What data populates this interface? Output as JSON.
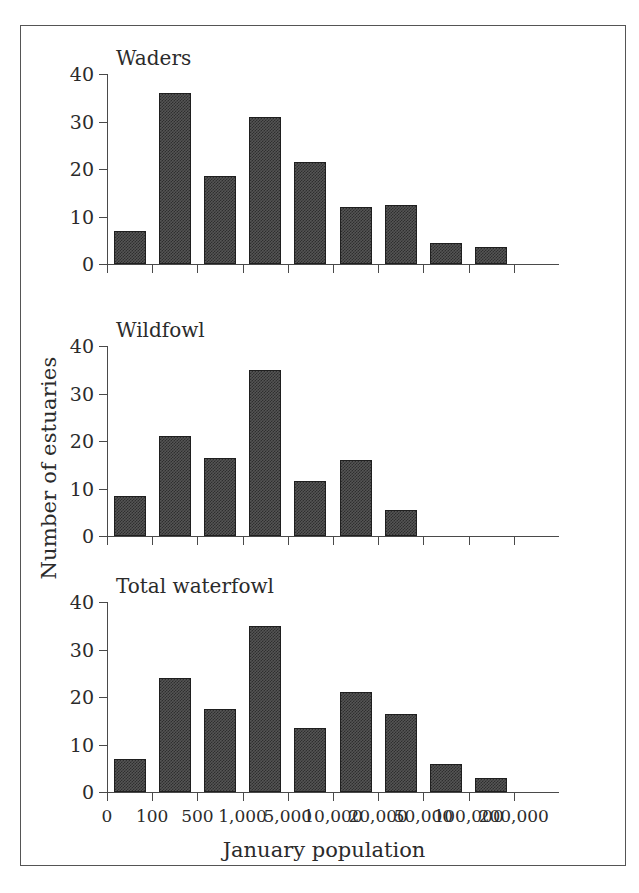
{
  "figure": {
    "y_axis_title": "Number of estuaries",
    "x_axis_title": "January population"
  },
  "chart_data": {
    "type": "bar",
    "title": "",
    "xlabel": "January population",
    "ylabel": "Number of estuaries",
    "ylim": [
      0,
      40
    ],
    "yticks": [
      0,
      10,
      20,
      30,
      40
    ],
    "ytick_labels": [
      "0",
      "10",
      "20",
      "30",
      "40"
    ],
    "grid": false,
    "legend": "none",
    "x_bin_edges": [
      0,
      100,
      500,
      1000,
      5000,
      10000,
      20000,
      50000,
      100000,
      200000
    ],
    "xtick_labels": [
      "0",
      "100",
      "500",
      "1,000",
      "5,000",
      "10,000",
      "20,000",
      "50,000",
      "100,000",
      "200,000"
    ],
    "bin_categories": [
      "0-100",
      "100-500",
      "500-1,000",
      "1,000-5,000",
      "5,000-10,000",
      "10,000-20,000",
      "20,000-50,000",
      "50,000-100,000",
      "100,000-200,000"
    ],
    "panels": [
      {
        "id": "waders",
        "title": "Waders",
        "values": [
          7,
          36,
          18.5,
          31,
          21.5,
          12,
          12.5,
          4.5,
          3.5
        ]
      },
      {
        "id": "wildfowl",
        "title": "Wildfowl",
        "values": [
          8.5,
          21,
          16.5,
          35,
          11.5,
          16,
          5.5,
          0,
          0
        ]
      },
      {
        "id": "total-waterfowl",
        "title": "Total waterfowl",
        "values": [
          7,
          24,
          17.5,
          35,
          13.5,
          21,
          16.5,
          6,
          3
        ]
      }
    ],
    "colors": {
      "bar_fill": "#3b3b3b",
      "bar_edge": "#1f1f1f",
      "axis": "#4a4a4a",
      "text": "#2b2b2b",
      "background": "#ffffff"
    }
  }
}
